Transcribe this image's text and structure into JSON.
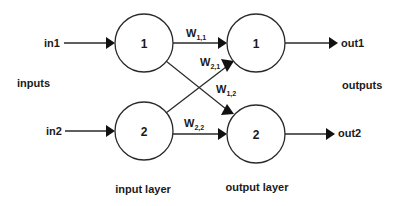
{
  "diagram": {
    "type": "neural-network",
    "input_labels": {
      "in1": "in1",
      "in2": "in2",
      "group": "inputs"
    },
    "output_labels": {
      "out1": "out1",
      "out2": "out2",
      "group": "outputs"
    },
    "layers": {
      "input": {
        "label": "input layer",
        "nodes": [
          "1",
          "2"
        ]
      },
      "output": {
        "label": "output layer",
        "nodes": [
          "1",
          "2"
        ]
      }
    },
    "weights": {
      "w11": {
        "base": "W",
        "sub": "1,1"
      },
      "w21": {
        "base": "W",
        "sub": "2,1"
      },
      "w12": {
        "base": "W",
        "sub": "1,2"
      },
      "w22": {
        "base": "W",
        "sub": "2,2"
      }
    },
    "colors": {
      "stroke": "#2a2a2a",
      "text": "#1a1a1a",
      "background": "#ffffff"
    }
  }
}
